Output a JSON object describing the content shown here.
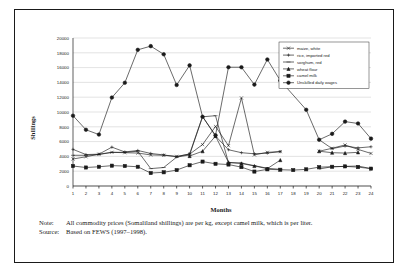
{
  "figure": {
    "note_label": "Note:",
    "note_text": "All commodity prices (Somaliland shillings) are per kg, except camel milk, which is per liter.",
    "source_label": "Source:",
    "source_text": "Based on FEWS (1997–1998)."
  },
  "chart_data": {
    "type": "line",
    "title": "",
    "xlabel": "Months",
    "ylabel": "Shillings",
    "xlim": [
      1,
      24
    ],
    "ylim": [
      0,
      20000
    ],
    "ytick_step": 2000,
    "grid": true,
    "legend_position": "top-right",
    "x": [
      1,
      2,
      3,
      4,
      5,
      6,
      7,
      8,
      9,
      10,
      11,
      12,
      13,
      14,
      15,
      16,
      17,
      18,
      19,
      20,
      21,
      22,
      23,
      24
    ],
    "xticklabels": [
      "1",
      "2",
      "3",
      "4",
      "5",
      "6",
      "7",
      "8",
      "9",
      "10",
      "11",
      "12",
      "13",
      "14",
      "15",
      "16",
      "17",
      "18",
      "19",
      "20",
      "21",
      "22",
      "23",
      "24"
    ],
    "yticklabels": [
      "0",
      "2000",
      "4000",
      "6000",
      "8000",
      "10000",
      "12000",
      "14000",
      "16000",
      "18000",
      "20000"
    ],
    "series": [
      {
        "name": "maize, white",
        "marker": "cross",
        "x": [
          1,
          2,
          3,
          4,
          5,
          6,
          7,
          8,
          9,
          10,
          11,
          12,
          13,
          14,
          15,
          16,
          17,
          19,
          20,
          21,
          22,
          23,
          24
        ],
        "values": [
          3650,
          3950,
          4300,
          4550,
          4500,
          4450,
          4200,
          4150,
          4000,
          4300,
          5600,
          8050,
          5450,
          11900,
          4200,
          4550,
          4650,
          null,
          4700,
          5100,
          5550,
          4950,
          4400
        ]
      },
      {
        "name": "rice, imported red",
        "marker": "plus",
        "x": [
          1,
          2,
          3,
          4,
          5,
          6,
          7,
          8,
          9,
          10,
          11,
          12,
          13,
          14,
          15,
          16,
          17,
          19,
          20,
          21,
          22,
          23,
          24
        ],
        "values": [
          4950,
          4250,
          4300,
          5250,
          4600,
          4800,
          4400,
          4200,
          3950,
          4350,
          9400,
          6750,
          4900,
          4500,
          4350,
          4450,
          4650,
          null,
          6250,
          5050,
          5400,
          5150,
          5300
        ]
      },
      {
        "name": "sorghum, red",
        "marker": "dash",
        "x": [
          1,
          2,
          3,
          4,
          5,
          6,
          7,
          8,
          9,
          10,
          11,
          12,
          13,
          14,
          15,
          16,
          17,
          19,
          20,
          21,
          22,
          23,
          24
        ],
        "values": [
          4150,
          4150,
          4250,
          4550,
          4550,
          4700,
          2350,
          2500,
          3900,
          4200,
          9350,
          9500,
          3150,
          3100,
          2750,
          2400,
          2250,
          null,
          2300,
          2600,
          2650,
          2700,
          2350
        ]
      },
      {
        "name": "wheat flour",
        "marker": "triangle",
        "x": [
          10,
          11,
          12,
          13,
          14,
          15,
          16,
          17,
          19,
          20,
          21,
          22,
          23,
          24
        ],
        "values": [
          4050,
          4700,
          6750,
          3200,
          3050,
          2700,
          2350,
          3500,
          null,
          4700,
          4500,
          4450,
          4550,
          null
        ]
      },
      {
        "name": "camel milk",
        "marker": "square",
        "x": [
          1,
          2,
          3,
          4,
          5,
          6,
          7,
          8,
          9,
          10,
          11,
          12,
          13,
          14,
          15,
          16,
          17,
          18,
          19,
          20,
          21,
          22,
          23,
          24
        ],
        "values": [
          2700,
          2500,
          2600,
          2750,
          2700,
          2600,
          1750,
          1850,
          2150,
          2800,
          3300,
          3000,
          2900,
          2550,
          1950,
          2250,
          2200,
          2150,
          2250,
          2550,
          2600,
          2650,
          2550,
          2350
        ]
      },
      {
        "name": "Unskilled daily wages",
        "marker": "circle",
        "x": [
          1,
          2,
          3,
          4,
          5,
          6,
          7,
          8,
          9,
          10,
          11,
          12,
          13,
          14,
          15,
          16,
          17,
          19,
          20,
          21,
          22,
          23,
          24
        ],
        "values": [
          9500,
          7600,
          6950,
          11950,
          13950,
          18400,
          18900,
          17800,
          13650,
          16300,
          9350,
          6850,
          16050,
          16050,
          13700,
          17100,
          14250,
          10300,
          6250,
          7050,
          8700,
          8450,
          6400
        ]
      }
    ]
  }
}
